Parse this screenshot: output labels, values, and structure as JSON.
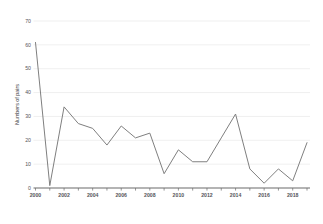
{
  "chart_data": {
    "type": "line",
    "title": "",
    "xlabel": "",
    "ylabel": "Numbers of pairs",
    "ylim": [
      0,
      70
    ],
    "xlim": [
      2000,
      2019
    ],
    "grid": true,
    "legend": "none",
    "y_ticks": [
      0,
      10,
      20,
      30,
      40,
      50,
      60,
      70
    ],
    "x_ticks": [
      2000,
      2002,
      2004,
      2006,
      2008,
      2010,
      2012,
      2014,
      2016,
      2018
    ],
    "x_ticks_minor": [
      2001,
      2003,
      2005,
      2007,
      2009,
      2011,
      2013,
      2015,
      2017,
      2019
    ],
    "x": [
      2000,
      2001,
      2002,
      2003,
      2004,
      2005,
      2006,
      2007,
      2008,
      2009,
      2010,
      2011,
      2012,
      2013,
      2014,
      2015,
      2016,
      2017,
      2018,
      2019
    ],
    "categories": [
      "2000",
      "2001",
      "2002",
      "2003",
      "2004",
      "2005",
      "2006",
      "2007",
      "2008",
      "2009",
      "2010",
      "2011",
      "2012",
      "2013",
      "2014",
      "2015",
      "2016",
      "2017",
      "2018",
      "2019"
    ],
    "values": [
      61,
      1,
      34,
      27,
      25,
      18,
      26,
      21,
      23,
      6,
      16,
      11,
      11,
      21,
      31,
      8,
      2,
      8,
      3,
      19
    ],
    "series": [
      {
        "name": "Numbers of pairs",
        "color": "#7f7f7f",
        "values": [
          61,
          1,
          34,
          27,
          25,
          18,
          26,
          21,
          23,
          6,
          16,
          11,
          11,
          21,
          31,
          8,
          2,
          8,
          3,
          19
        ]
      }
    ],
    "colors": {
      "line": "#7f7f7f",
      "grid": "#e8e8e8",
      "axis": "#6b6b6b",
      "text": "#55555a",
      "background": "#ffffff"
    }
  }
}
